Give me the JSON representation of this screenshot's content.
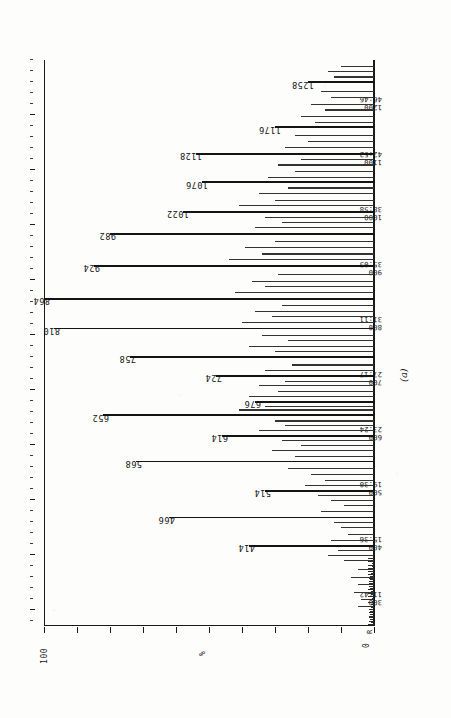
{
  "figure": {
    "sublabel": "(a)",
    "origin_marker": "R"
  },
  "yaxis": {
    "top_label": "100",
    "mid_label": "%",
    "bottom_label": "0"
  },
  "chart_data": {
    "type": "line",
    "title": "",
    "subtitle": "",
    "xlabel": "Scan / Time (min:sec)",
    "ylabel": "%",
    "ylim": [
      0,
      100
    ],
    "xlim": [
      270,
      1300
    ],
    "grid": false,
    "legend": null,
    "orientation": "rotated-90",
    "axis_ticks": [
      {
        "scan": "300",
        "time": "11:42"
      },
      {
        "scan": "400",
        "time": "15:36"
      },
      {
        "scan": "500",
        "time": "19:30"
      },
      {
        "scan": "600",
        "time": "23:24"
      },
      {
        "scan": "700",
        "time": "27:17"
      },
      {
        "scan": "800",
        "time": "31:11"
      },
      {
        "scan": "900",
        "time": "35:05"
      },
      {
        "scan": "1000",
        "time": "38:58"
      },
      {
        "scan": "1100",
        "time": "42:52"
      },
      {
        "scan": "1200",
        "time": "46:46"
      }
    ],
    "labeled_peaks": [
      {
        "label": "414",
        "scan": 414,
        "intensity": 38
      },
      {
        "label": "466",
        "scan": 466,
        "intensity": 62
      },
      {
        "label": "514",
        "scan": 514,
        "intensity": 33
      },
      {
        "label": "568",
        "scan": 568,
        "intensity": 72
      },
      {
        "label": "614",
        "scan": 614,
        "intensity": 46
      },
      {
        "label": "652",
        "scan": 652,
        "intensity": 82
      },
      {
        "label": "676",
        "scan": 676,
        "intensity": 36
      },
      {
        "label": "724",
        "scan": 724,
        "intensity": 48
      },
      {
        "label": "758",
        "scan": 758,
        "intensity": 74
      },
      {
        "label": "810",
        "scan": 810,
        "intensity": 97
      },
      {
        "label": "864",
        "scan": 864,
        "intensity": 100
      },
      {
        "label": "924",
        "scan": 924,
        "intensity": 85
      },
      {
        "label": "982",
        "scan": 982,
        "intensity": 80
      },
      {
        "label": "1022",
        "scan": 1022,
        "intensity": 58
      },
      {
        "label": "1076",
        "scan": 1076,
        "intensity": 52
      },
      {
        "label": "1128",
        "scan": 1128,
        "intensity": 54
      },
      {
        "label": "1176",
        "scan": 1176,
        "intensity": 30
      },
      {
        "label": "1258",
        "scan": 1258,
        "intensity": 20
      }
    ],
    "unlabeled_peaks": [
      {
        "scan": 305,
        "intensity": 5
      },
      {
        "scan": 318,
        "intensity": 4
      },
      {
        "scan": 330,
        "intensity": 6
      },
      {
        "scan": 344,
        "intensity": 5
      },
      {
        "scan": 358,
        "intensity": 7
      },
      {
        "scan": 372,
        "intensity": 5
      },
      {
        "scan": 388,
        "intensity": 9
      },
      {
        "scan": 398,
        "intensity": 14
      },
      {
        "scan": 406,
        "intensity": 11
      },
      {
        "scan": 424,
        "intensity": 13
      },
      {
        "scan": 436,
        "intensity": 8
      },
      {
        "scan": 448,
        "intensity": 10
      },
      {
        "scan": 458,
        "intensity": 12
      },
      {
        "scan": 478,
        "intensity": 16
      },
      {
        "scan": 488,
        "intensity": 9
      },
      {
        "scan": 498,
        "intensity": 13
      },
      {
        "scan": 506,
        "intensity": 17
      },
      {
        "scan": 524,
        "intensity": 21
      },
      {
        "scan": 534,
        "intensity": 15
      },
      {
        "scan": 544,
        "intensity": 19
      },
      {
        "scan": 556,
        "intensity": 26
      },
      {
        "scan": 578,
        "intensity": 24
      },
      {
        "scan": 588,
        "intensity": 31
      },
      {
        "scan": 598,
        "intensity": 22
      },
      {
        "scan": 606,
        "intensity": 28
      },
      {
        "scan": 624,
        "intensity": 35
      },
      {
        "scan": 634,
        "intensity": 27
      },
      {
        "scan": 642,
        "intensity": 30
      },
      {
        "scan": 662,
        "intensity": 41
      },
      {
        "scan": 668,
        "intensity": 33
      },
      {
        "scan": 686,
        "intensity": 38
      },
      {
        "scan": 696,
        "intensity": 29
      },
      {
        "scan": 706,
        "intensity": 35
      },
      {
        "scan": 714,
        "intensity": 27
      },
      {
        "scan": 734,
        "intensity": 33
      },
      {
        "scan": 744,
        "intensity": 25
      },
      {
        "scan": 768,
        "intensity": 30
      },
      {
        "scan": 778,
        "intensity": 38
      },
      {
        "scan": 788,
        "intensity": 26
      },
      {
        "scan": 798,
        "intensity": 34
      },
      {
        "scan": 822,
        "intensity": 40
      },
      {
        "scan": 832,
        "intensity": 31
      },
      {
        "scan": 842,
        "intensity": 36
      },
      {
        "scan": 852,
        "intensity": 28
      },
      {
        "scan": 876,
        "intensity": 42
      },
      {
        "scan": 886,
        "intensity": 33
      },
      {
        "scan": 896,
        "intensity": 37
      },
      {
        "scan": 908,
        "intensity": 29
      },
      {
        "scan": 936,
        "intensity": 44
      },
      {
        "scan": 946,
        "intensity": 34
      },
      {
        "scan": 958,
        "intensity": 39
      },
      {
        "scan": 968,
        "intensity": 30
      },
      {
        "scan": 994,
        "intensity": 36
      },
      {
        "scan": 1004,
        "intensity": 28
      },
      {
        "scan": 1012,
        "intensity": 33
      },
      {
        "scan": 1034,
        "intensity": 41
      },
      {
        "scan": 1044,
        "intensity": 30
      },
      {
        "scan": 1056,
        "intensity": 35
      },
      {
        "scan": 1066,
        "intensity": 26
      },
      {
        "scan": 1086,
        "intensity": 32
      },
      {
        "scan": 1096,
        "intensity": 24
      },
      {
        "scan": 1108,
        "intensity": 29
      },
      {
        "scan": 1118,
        "intensity": 22
      },
      {
        "scan": 1140,
        "intensity": 27
      },
      {
        "scan": 1150,
        "intensity": 20
      },
      {
        "scan": 1162,
        "intensity": 24
      },
      {
        "scan": 1186,
        "intensity": 18
      },
      {
        "scan": 1196,
        "intensity": 22
      },
      {
        "scan": 1208,
        "intensity": 15
      },
      {
        "scan": 1218,
        "intensity": 19
      },
      {
        "scan": 1230,
        "intensity": 13
      },
      {
        "scan": 1242,
        "intensity": 16
      },
      {
        "scan": 1268,
        "intensity": 12
      },
      {
        "scan": 1278,
        "intensity": 14
      },
      {
        "scan": 1288,
        "intensity": 10
      }
    ]
  }
}
